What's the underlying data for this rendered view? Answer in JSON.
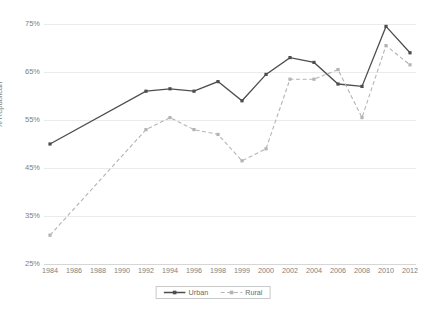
{
  "chart_data": {
    "type": "line",
    "title": "",
    "subtitle": "",
    "xlabel": "",
    "ylabel": "% Republican",
    "ylim": [
      25,
      75
    ],
    "ytick_values": [
      75,
      65,
      55,
      45,
      35,
      25
    ],
    "ytick_labels": [
      "75%",
      "65%",
      "55%",
      "45%",
      "35%",
      "25%"
    ],
    "categories": [
      "1984",
      "1986",
      "1988",
      "1990",
      "1992",
      "1994",
      "1996",
      "1998",
      "1999",
      "2000",
      "2002",
      "2004",
      "2006",
      "2008",
      "2010",
      "2012"
    ],
    "grid": true,
    "legend_position": "bottom-center",
    "series": [
      {
        "name": "Urban",
        "color": "#4d4d4d",
        "style": "solid",
        "marker": "square",
        "points": [
          {
            "x": "1984",
            "y": 50
          },
          {
            "x": "1992",
            "y": 61
          },
          {
            "x": "1994",
            "y": 61.5
          },
          {
            "x": "1996",
            "y": 61
          },
          {
            "x": "1998",
            "y": 63
          },
          {
            "x": "1999",
            "y": 59
          },
          {
            "x": "2000",
            "y": 64.5
          },
          {
            "x": "2002",
            "y": 68
          },
          {
            "x": "2004",
            "y": 67
          },
          {
            "x": "2006",
            "y": 62.5
          },
          {
            "x": "2008",
            "y": 62
          },
          {
            "x": "2010",
            "y": 74.5
          },
          {
            "x": "2012",
            "y": 69
          }
        ]
      },
      {
        "name": "Rural",
        "color": "#b4b4b4",
        "style": "dashed",
        "marker": "square",
        "points": [
          {
            "x": "1984",
            "y": 31
          },
          {
            "x": "1992",
            "y": 53
          },
          {
            "x": "1994",
            "y": 55.5
          },
          {
            "x": "1996",
            "y": 53
          },
          {
            "x": "1998",
            "y": 52
          },
          {
            "x": "1999",
            "y": 46.5
          },
          {
            "x": "2000",
            "y": 49
          },
          {
            "x": "2002",
            "y": 63.5
          },
          {
            "x": "2004",
            "y": 63.5
          },
          {
            "x": "2006",
            "y": 65.5
          },
          {
            "x": "2008",
            "y": 55.5
          },
          {
            "x": "2010",
            "y": 70.5
          },
          {
            "x": "2012",
            "y": 66.5
          }
        ]
      }
    ],
    "legend": [
      {
        "label": "Urban",
        "color": "#4d4d4d",
        "style": "solid"
      },
      {
        "label": "Rural",
        "color": "#b4b4b4",
        "style": "dashed"
      }
    ]
  }
}
